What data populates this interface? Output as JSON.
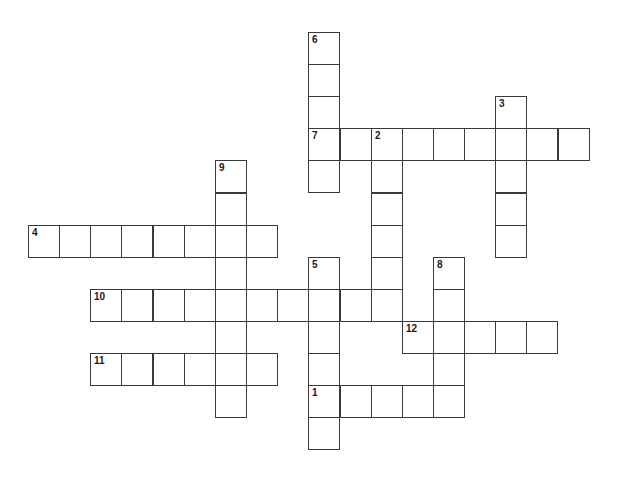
{
  "puzzle": {
    "type": "crossword",
    "grid_origin": {
      "x": 28,
      "y": 32
    },
    "cell_pitch": {
      "x": 31.15,
      "y": 32.1
    },
    "colors": {
      "border": "#3a3a3a",
      "background": "#ffffff",
      "number": "#1a1a1a"
    },
    "entries": [
      {
        "number": "1",
        "direction": "across",
        "row": 11,
        "col": 9,
        "length": 5
      },
      {
        "number": "2",
        "direction": "down",
        "row": 3,
        "col": 11,
        "length": 6
      },
      {
        "number": "3",
        "direction": "down",
        "row": 2,
        "col": 15,
        "length": 5
      },
      {
        "number": "4",
        "direction": "across",
        "row": 6,
        "col": 0,
        "length": 8
      },
      {
        "number": "5",
        "direction": "down",
        "row": 7,
        "col": 9,
        "length": 6
      },
      {
        "number": "6",
        "direction": "down",
        "row": 0,
        "col": 9,
        "length": 5
      },
      {
        "number": "7",
        "direction": "across",
        "row": 3,
        "col": 9,
        "length": 9
      },
      {
        "number": "8",
        "direction": "down",
        "row": 7,
        "col": 13,
        "length": 5
      },
      {
        "number": "9",
        "direction": "down",
        "row": 4,
        "col": 6,
        "length": 8
      },
      {
        "number": "10",
        "direction": "across",
        "row": 8,
        "col": 2,
        "length": 10
      },
      {
        "number": "11",
        "direction": "across",
        "row": 10,
        "col": 2,
        "length": 6
      },
      {
        "number": "12",
        "direction": "across",
        "row": 9,
        "col": 12,
        "length": 5
      }
    ]
  }
}
